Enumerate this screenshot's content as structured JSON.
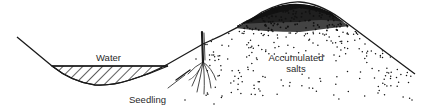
{
  "diagram": {
    "labels": {
      "water": "Water",
      "seedling": "Seedling",
      "salts_line1": "Accumulated",
      "salts_line2": "salts"
    },
    "elements": [
      {
        "id": "ground-surface-profile",
        "kind": "line"
      },
      {
        "id": "water-body",
        "kind": "hatched-region"
      },
      {
        "id": "seedling",
        "kind": "plant"
      },
      {
        "id": "salt-deposit",
        "kind": "stipple",
        "density": "dense at ridge crest, sparse below"
      }
    ],
    "colors": {
      "ink": "#1a1a1a",
      "label": "#2a2a2a",
      "background": "#ffffff"
    }
  }
}
